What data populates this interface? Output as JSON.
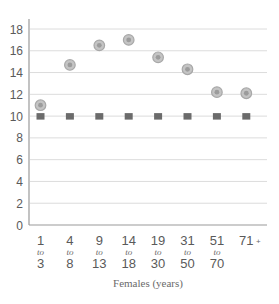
{
  "chart_data": {
    "type": "scatter",
    "title": "",
    "xlabel": "Females (years)",
    "ylabel": "",
    "ylim": [
      0,
      18
    ],
    "yticks": [
      0,
      2,
      4,
      6,
      8,
      10,
      12,
      14,
      16,
      18
    ],
    "grid": true,
    "legend": "none",
    "categories": [
      {
        "from": "1",
        "connector": "to",
        "to": "3"
      },
      {
        "from": "4",
        "connector": "to",
        "to": "8"
      },
      {
        "from": "9",
        "connector": "to",
        "to": "13"
      },
      {
        "from": "14",
        "connector": "to",
        "to": "18"
      },
      {
        "from": "19",
        "connector": "to",
        "to": "30"
      },
      {
        "from": "31",
        "connector": "to",
        "to": "50"
      },
      {
        "from": "51",
        "connector": "to",
        "to": "70"
      },
      {
        "from": "71",
        "connector": "",
        "to": "",
        "suffix": "+"
      }
    ],
    "series": [
      {
        "name": "circle-series",
        "marker": "circle",
        "color": "#a8a8a8",
        "values": [
          11.0,
          14.7,
          16.5,
          17.0,
          15.4,
          14.3,
          12.2,
          12.1
        ]
      },
      {
        "name": "square-series",
        "marker": "square",
        "color": "#6b6b6b",
        "values": [
          10,
          10,
          10,
          10,
          10,
          10,
          10,
          10
        ]
      }
    ]
  },
  "colors": {
    "grid": "#dcdcdc",
    "axis": "#9a9a9a"
  }
}
